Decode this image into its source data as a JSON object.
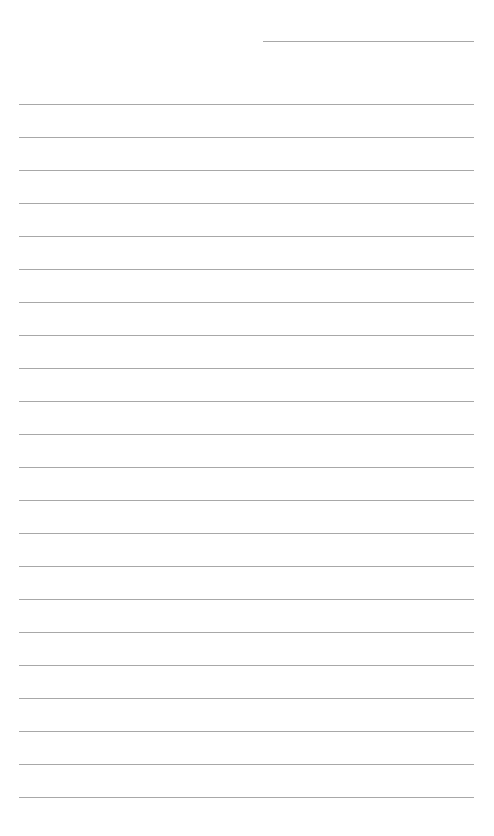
{
  "page": {
    "type": "lined-writing-paper",
    "background_color": "#ffffff",
    "line_color": "#a8a8a8"
  },
  "header": {
    "name_line": {
      "x": 263,
      "y": 41,
      "width": 211
    }
  },
  "lines": {
    "count": 22,
    "start_y": 104,
    "spacing": 33,
    "x": 19,
    "width": 455
  }
}
